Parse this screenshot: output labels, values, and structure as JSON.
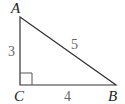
{
  "diagram": {
    "type": "right-triangle",
    "colors": {
      "line": "#333333",
      "vertex_label": "#222222",
      "side_label": "#666666",
      "background": "#ffffff"
    },
    "vertices": {
      "A": {
        "label": "A",
        "x": 20,
        "y": 17
      },
      "B": {
        "label": "B",
        "x": 116,
        "y": 85
      },
      "C": {
        "label": "C",
        "x": 20,
        "y": 85
      }
    },
    "sides": {
      "AC": {
        "label": "3"
      },
      "CB": {
        "label": "4"
      },
      "AB": {
        "label": "5"
      }
    },
    "right_angle_at": "C"
  }
}
